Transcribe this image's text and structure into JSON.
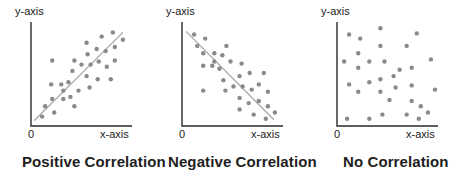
{
  "colors": {
    "axis": "#2a2a2a",
    "dot": "#8a8a8a",
    "trend": "#a9a9a9",
    "title": "#1e1e1e"
  },
  "chart_data": [
    {
      "type": "scatter",
      "title": "Positive Correlation",
      "xlabel": "x-axis",
      "ylabel": "y-axis",
      "origin_label": "0",
      "grid": false,
      "trend_line": {
        "from": [
          0.03,
          0.05
        ],
        "to": [
          0.91,
          0.9
        ]
      },
      "points": [
        [
          0.11,
          0.09
        ],
        [
          0.23,
          0.13
        ],
        [
          0.14,
          0.19
        ],
        [
          0.21,
          0.26
        ],
        [
          0.32,
          0.26
        ],
        [
          0.39,
          0.28
        ],
        [
          0.43,
          0.19
        ],
        [
          0.32,
          0.34
        ],
        [
          0.2,
          0.4
        ],
        [
          0.3,
          0.4
        ],
        [
          0.37,
          0.42
        ],
        [
          0.47,
          0.34
        ],
        [
          0.58,
          0.37
        ],
        [
          0.55,
          0.48
        ],
        [
          0.41,
          0.53
        ],
        [
          0.5,
          0.59
        ],
        [
          0.43,
          0.63
        ],
        [
          0.21,
          0.63
        ],
        [
          0.59,
          0.59
        ],
        [
          0.66,
          0.45
        ],
        [
          0.67,
          0.62
        ],
        [
          0.75,
          0.57
        ],
        [
          0.79,
          0.45
        ],
        [
          0.56,
          0.69
        ],
        [
          0.65,
          0.74
        ],
        [
          0.74,
          0.72
        ],
        [
          0.83,
          0.63
        ],
        [
          0.83,
          0.76
        ],
        [
          0.55,
          0.8
        ],
        [
          0.7,
          0.86
        ],
        [
          0.81,
          0.9
        ],
        [
          0.91,
          0.83
        ]
      ],
      "panel": {
        "x0": 31,
        "y_top": 22,
        "y_bottom": 126,
        "x_end": 132
      }
    },
    {
      "type": "scatter",
      "title": "Negative Correlation",
      "xlabel": "x-axis",
      "ylabel": "y-axis",
      "origin_label": "0",
      "grid": false,
      "trend_line": {
        "from": [
          0.04,
          0.91
        ],
        "to": [
          0.91,
          0.06
        ]
      },
      "points": [
        [
          0.12,
          0.88
        ],
        [
          0.23,
          0.84
        ],
        [
          0.15,
          0.77
        ],
        [
          0.21,
          0.7
        ],
        [
          0.32,
          0.7
        ],
        [
          0.4,
          0.68
        ],
        [
          0.44,
          0.77
        ],
        [
          0.32,
          0.62
        ],
        [
          0.21,
          0.58
        ],
        [
          0.3,
          0.58
        ],
        [
          0.37,
          0.55
        ],
        [
          0.48,
          0.62
        ],
        [
          0.59,
          0.6
        ],
        [
          0.41,
          0.44
        ],
        [
          0.57,
          0.48
        ],
        [
          0.67,
          0.51
        ],
        [
          0.81,
          0.51
        ],
        [
          0.21,
          0.34
        ],
        [
          0.43,
          0.34
        ],
        [
          0.51,
          0.38
        ],
        [
          0.6,
          0.38
        ],
        [
          0.69,
          0.35
        ],
        [
          0.76,
          0.4
        ],
        [
          0.85,
          0.33
        ],
        [
          0.57,
          0.27
        ],
        [
          0.66,
          0.22
        ],
        [
          0.76,
          0.24
        ],
        [
          0.85,
          0.19
        ],
        [
          0.57,
          0.16
        ],
        [
          0.71,
          0.11
        ],
        [
          0.83,
          0.07
        ],
        [
          0.92,
          0.13
        ]
      ],
      "panel": {
        "x0": 182,
        "y_top": 22,
        "y_bottom": 126,
        "x_end": 283
      }
    },
    {
      "type": "scatter",
      "title": "No Correlation",
      "xlabel": "x-axis",
      "ylabel": "y-axis",
      "origin_label": "0",
      "grid": false,
      "trend_line": null,
      "points": [
        [
          0.12,
          0.88
        ],
        [
          0.43,
          0.94
        ],
        [
          0.79,
          0.89
        ],
        [
          0.23,
          0.84
        ],
        [
          0.43,
          0.77
        ],
        [
          0.69,
          0.77
        ],
        [
          0.21,
          0.7
        ],
        [
          0.07,
          0.62
        ],
        [
          0.32,
          0.62
        ],
        [
          0.47,
          0.62
        ],
        [
          0.93,
          0.64
        ],
        [
          0.21,
          0.56
        ],
        [
          0.74,
          0.56
        ],
        [
          0.62,
          0.54
        ],
        [
          0.12,
          0.4
        ],
        [
          0.32,
          0.42
        ],
        [
          0.43,
          0.45
        ],
        [
          0.56,
          0.48
        ],
        [
          0.74,
          0.39
        ],
        [
          0.58,
          0.37
        ],
        [
          0.21,
          0.33
        ],
        [
          0.43,
          0.33
        ],
        [
          0.97,
          0.35
        ],
        [
          0.52,
          0.25
        ],
        [
          0.74,
          0.24
        ],
        [
          0.83,
          0.19
        ],
        [
          0.9,
          0.13
        ],
        [
          0.1,
          0.07
        ],
        [
          0.32,
          0.07
        ],
        [
          0.45,
          0.11
        ],
        [
          0.69,
          0.11
        ],
        [
          0.81,
          0.07
        ]
      ],
      "panel": {
        "x0": 337,
        "y_top": 22,
        "y_bottom": 126,
        "x_end": 438
      }
    }
  ],
  "titles": [
    "Positive Correlation",
    "Negative Correlation",
    "No Correlation"
  ],
  "axis_labels": {
    "y": "y-axis",
    "x": "x-axis",
    "origin": "0"
  }
}
